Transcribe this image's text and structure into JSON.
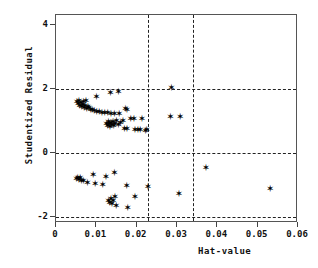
{
  "chart_data": {
    "type": "scatter",
    "title": "",
    "xlabel": "Hat-value",
    "ylabel": "Studentized Residual",
    "xlim": [
      0,
      0.06
    ],
    "ylim": [
      -2.2,
      4.3
    ],
    "xticks": [
      0,
      0.01,
      0.02,
      0.03,
      0.04,
      0.05,
      0.06
    ],
    "xticklabels": [
      "0",
      "0.01",
      "0.02",
      "0.03",
      "0.04",
      "0.05",
      "0.06"
    ],
    "yticks": [
      4,
      2,
      0,
      -2
    ],
    "yticklabels": [
      "4",
      "2",
      "0",
      "-2"
    ],
    "grid": false,
    "marker": "star",
    "marker_glyph": "✶",
    "marker_color": "#000000",
    "reference_lines": {
      "horizontal": [
        {
          "y": 2,
          "style": "dashed"
        },
        {
          "y": 0,
          "style": "dashed"
        },
        {
          "y": -2,
          "style": "dashed"
        }
      ],
      "vertical": [
        {
          "x": 0.0227,
          "style": "dashed"
        },
        {
          "x": 0.034,
          "style": "dashed"
        }
      ],
      "color": "#222222"
    },
    "points": [
      {
        "x": 0.0052,
        "y": 1.58
      },
      {
        "x": 0.0055,
        "y": 1.52
      },
      {
        "x": 0.0057,
        "y": 1.62
      },
      {
        "x": 0.0059,
        "y": 1.47
      },
      {
        "x": 0.0062,
        "y": 1.55
      },
      {
        "x": 0.0064,
        "y": 1.43
      },
      {
        "x": 0.0066,
        "y": 1.5
      },
      {
        "x": 0.0068,
        "y": 1.57
      },
      {
        "x": 0.007,
        "y": 1.4
      },
      {
        "x": 0.0072,
        "y": 1.46
      },
      {
        "x": 0.0074,
        "y": 1.62
      },
      {
        "x": 0.0076,
        "y": 1.36
      },
      {
        "x": 0.0079,
        "y": 1.44
      },
      {
        "x": 0.0082,
        "y": 1.38
      },
      {
        "x": 0.0086,
        "y": 1.34
      },
      {
        "x": 0.009,
        "y": 1.32
      },
      {
        "x": 0.0095,
        "y": 1.3
      },
      {
        "x": 0.01,
        "y": 1.74
      },
      {
        "x": 0.0101,
        "y": 1.28
      },
      {
        "x": 0.0107,
        "y": 1.27
      },
      {
        "x": 0.0114,
        "y": 1.25
      },
      {
        "x": 0.0121,
        "y": 1.24
      },
      {
        "x": 0.0128,
        "y": 1.23
      },
      {
        "x": 0.0135,
        "y": 1.86
      },
      {
        "x": 0.0136,
        "y": 1.22
      },
      {
        "x": 0.0145,
        "y": 1.21
      },
      {
        "x": 0.0155,
        "y": 1.9
      },
      {
        "x": 0.0157,
        "y": 1.2
      },
      {
        "x": 0.0172,
        "y": 1.35
      },
      {
        "x": 0.0176,
        "y": 1.33
      },
      {
        "x": 0.0125,
        "y": 0.9
      },
      {
        "x": 0.0128,
        "y": 0.84
      },
      {
        "x": 0.013,
        "y": 0.96
      },
      {
        "x": 0.0132,
        "y": 0.88
      },
      {
        "x": 0.0134,
        "y": 0.8
      },
      {
        "x": 0.0136,
        "y": 0.92
      },
      {
        "x": 0.0138,
        "y": 0.86
      },
      {
        "x": 0.0141,
        "y": 0.95
      },
      {
        "x": 0.0143,
        "y": 0.82
      },
      {
        "x": 0.0146,
        "y": 0.9
      },
      {
        "x": 0.015,
        "y": 0.98
      },
      {
        "x": 0.0155,
        "y": 0.87
      },
      {
        "x": 0.016,
        "y": 0.94
      },
      {
        "x": 0.0166,
        "y": 0.99
      },
      {
        "x": 0.017,
        "y": 0.75
      },
      {
        "x": 0.0176,
        "y": 0.74
      },
      {
        "x": 0.0185,
        "y": 1.05
      },
      {
        "x": 0.0193,
        "y": 1.04
      },
      {
        "x": 0.0196,
        "y": 0.72
      },
      {
        "x": 0.0203,
        "y": 0.71
      },
      {
        "x": 0.0209,
        "y": 0.7
      },
      {
        "x": 0.0213,
        "y": 1.06
      },
      {
        "x": 0.0222,
        "y": 0.69
      },
      {
        "x": 0.0225,
        "y": 0.72
      },
      {
        "x": 0.0286,
        "y": 2.02
      },
      {
        "x": 0.0284,
        "y": 1.1
      },
      {
        "x": 0.0308,
        "y": 1.12
      },
      {
        "x": 0.0051,
        "y": -0.82
      },
      {
        "x": 0.0054,
        "y": -0.78
      },
      {
        "x": 0.0057,
        "y": -0.86
      },
      {
        "x": 0.006,
        "y": -0.8
      },
      {
        "x": 0.0063,
        "y": -0.88
      },
      {
        "x": 0.0068,
        "y": -0.9
      },
      {
        "x": 0.0078,
        "y": -0.95
      },
      {
        "x": 0.0092,
        "y": -0.7
      },
      {
        "x": 0.0097,
        "y": -0.97
      },
      {
        "x": 0.0116,
        "y": -1.02
      },
      {
        "x": 0.0124,
        "y": -0.75
      },
      {
        "x": 0.0145,
        "y": -0.64
      },
      {
        "x": 0.0175,
        "y": -1.05
      },
      {
        "x": 0.0196,
        "y": -1.38
      },
      {
        "x": 0.013,
        "y": -1.5
      },
      {
        "x": 0.0133,
        "y": -1.56
      },
      {
        "x": 0.0136,
        "y": -1.44
      },
      {
        "x": 0.0139,
        "y": -1.6
      },
      {
        "x": 0.0142,
        "y": -1.52
      },
      {
        "x": 0.0146,
        "y": -1.4
      },
      {
        "x": 0.0149,
        "y": -1.68
      },
      {
        "x": 0.0178,
        "y": -1.72
      },
      {
        "x": 0.0228,
        "y": -1.08
      },
      {
        "x": 0.0305,
        "y": -1.3
      },
      {
        "x": 0.0372,
        "y": -0.48
      },
      {
        "x": 0.0531,
        "y": -1.15
      }
    ]
  },
  "axes": {
    "frame_color": "#555555",
    "tick_color": "#444444"
  }
}
